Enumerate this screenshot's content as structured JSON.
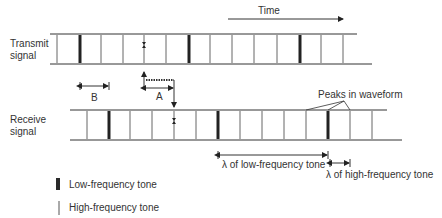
{
  "time_label": "Time",
  "transmit": {
    "label_line1": "Transmit",
    "label_line2": "signal",
    "top_y": 34,
    "bottom_y": 64,
    "top_x": [
      50,
      357
    ],
    "bottom_x": [
      50,
      372
    ],
    "lines": [
      {
        "x": 57,
        "type": "high"
      },
      {
        "x": 80,
        "type": "low"
      },
      {
        "x": 101,
        "type": "high"
      },
      {
        "x": 123,
        "type": "high"
      },
      {
        "x": 144,
        "type": "high",
        "marker": true
      },
      {
        "x": 166,
        "type": "high"
      },
      {
        "x": 189,
        "type": "low"
      },
      {
        "x": 210,
        "type": "high"
      },
      {
        "x": 232,
        "type": "high"
      },
      {
        "x": 254,
        "type": "high"
      },
      {
        "x": 277,
        "type": "high"
      },
      {
        "x": 300,
        "type": "low"
      },
      {
        "x": 321,
        "type": "high"
      },
      {
        "x": 343,
        "type": "high"
      }
    ]
  },
  "receive": {
    "label_line1": "Receive",
    "label_line2": "signal",
    "top_y": 110,
    "bottom_y": 140,
    "top_x": [
      70,
      387
    ],
    "bottom_x": [
      70,
      402
    ],
    "lines": [
      {
        "x": 87,
        "type": "high"
      },
      {
        "x": 109,
        "type": "low"
      },
      {
        "x": 130,
        "type": "high"
      },
      {
        "x": 152,
        "type": "high"
      },
      {
        "x": 174,
        "type": "high",
        "marker": true
      },
      {
        "x": 196,
        "type": "high"
      },
      {
        "x": 218,
        "type": "low"
      },
      {
        "x": 240,
        "type": "high"
      },
      {
        "x": 262,
        "type": "high"
      },
      {
        "x": 284,
        "type": "high"
      },
      {
        "x": 306,
        "type": "high"
      },
      {
        "x": 328,
        "type": "low"
      },
      {
        "x": 350,
        "type": "high"
      },
      {
        "x": 372,
        "type": "high"
      }
    ]
  },
  "annotations": {
    "a_label": "A",
    "b_label": "B",
    "peaks_label": "Peaks in waveform",
    "lambda_low": "λ of low-frequency tone",
    "lambda_high": "λ of high-frequency tone"
  },
  "legend": {
    "low_label": "Low-frequency tone",
    "high_label": "High-frequency tone"
  },
  "colors": {
    "line": "#333333",
    "low_tone": "#222222",
    "text": "#333333"
  }
}
